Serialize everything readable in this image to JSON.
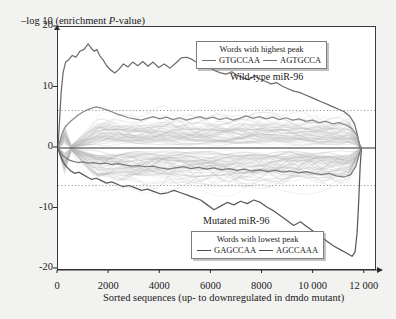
{
  "chart_data": {
    "type": "line",
    "title": "",
    "ylabel": "–log 10 (enrichment P-value)",
    "xlabel": "Sorted sequences (up- to downregulated in dmdo mutant)",
    "xlim": [
      0,
      12400
    ],
    "ylim": [
      -20,
      20
    ],
    "xticks": [
      0,
      2000,
      4000,
      6000,
      8000,
      10000,
      12000
    ],
    "xtick_labels": [
      "0",
      "2000",
      "4000",
      "6000",
      "8000",
      "10 000",
      "12 000"
    ],
    "yticks": [
      20,
      10,
      0,
      -10,
      -20
    ],
    "ytick_labels": [
      "20",
      "10",
      "0",
      "-10",
      "-20"
    ],
    "grid": false,
    "legend_position": "inside-top-right",
    "threshold_lines": [
      6.2,
      -6.2
    ],
    "threshold_style": "dotted",
    "zero_line": 0,
    "annotations": [
      {
        "text": "Wild-type miR-96",
        "x": 7200,
        "y": 12.2
      },
      {
        "text": "Mutated miR-96",
        "x": 5800,
        "y": -11.6
      }
    ],
    "series": [
      {
        "name": "GTGCCAA",
        "group": "highest-peak",
        "color": "#6b6b6b",
        "x": [
          0,
          60,
          120,
          200,
          300,
          420,
          560,
          700,
          860,
          1020,
          1180,
          1320,
          1420,
          1520,
          1640,
          1760,
          1900,
          2060,
          2220,
          2380,
          2560,
          2740,
          2920,
          3120,
          3320,
          3520,
          3720,
          3940,
          4160,
          4380,
          4600,
          4820,
          5040,
          5260,
          5480,
          5700,
          5920,
          6140,
          6360,
          6580,
          6800,
          7020,
          7240,
          7460,
          7680,
          7900,
          8120,
          8340,
          8560,
          8780,
          9000,
          9220,
          9440,
          9660,
          9880,
          10100,
          10320,
          10540,
          10760,
          10980,
          11200,
          11420,
          11600,
          11720,
          11800,
          11850
        ],
        "y": [
          0,
          4.5,
          9.0,
          12.5,
          14.2,
          14.6,
          15.3,
          15.0,
          16.0,
          16.3,
          17.2,
          16.4,
          16.0,
          16.3,
          15.2,
          14.6,
          13.6,
          12.9,
          12.4,
          13.0,
          13.9,
          13.4,
          14.2,
          13.6,
          14.3,
          13.5,
          14.2,
          13.3,
          13.9,
          13.2,
          14.0,
          14.9,
          15.0,
          14.6,
          14.0,
          13.6,
          13.3,
          12.8,
          12.4,
          12.2,
          12.6,
          12.0,
          11.6,
          11.3,
          11.9,
          11.4,
          11.0,
          10.6,
          10.8,
          10.2,
          9.8,
          9.4,
          9.2,
          8.8,
          8.4,
          8.0,
          7.6,
          7.2,
          6.8,
          6.4,
          6.0,
          5.2,
          4.0,
          2.0,
          0.3,
          0
        ]
      },
      {
        "name": "AGTGCCA",
        "group": "highest-peak",
        "color": "#8a8a8a",
        "x": [
          0,
          80,
          180,
          300,
          440,
          600,
          780,
          960,
          1140,
          1320,
          1500,
          1700,
          1900,
          2100,
          2320,
          2540,
          2760,
          3000,
          3240,
          3480,
          3720,
          3980,
          4240,
          4500,
          4760,
          5020,
          5280,
          5540,
          5800,
          6060,
          6320,
          6580,
          6840,
          7100,
          7360,
          7620,
          7880,
          8140,
          8400,
          8660,
          8920,
          9180,
          9440,
          9700,
          9960,
          10220,
          10480,
          10740,
          11000,
          11260,
          11500,
          11680,
          11800,
          11860
        ],
        "y": [
          0,
          1.2,
          2.6,
          3.6,
          4.2,
          4.8,
          5.4,
          5.9,
          6.3,
          6.6,
          6.8,
          6.6,
          6.3,
          6.0,
          5.6,
          5.3,
          5.0,
          4.8,
          4.6,
          4.9,
          5.2,
          4.8,
          5.1,
          4.7,
          5.0,
          4.6,
          4.9,
          5.2,
          4.8,
          5.1,
          4.7,
          5.0,
          4.6,
          4.9,
          5.3,
          4.9,
          5.2,
          4.8,
          5.1,
          4.7,
          5.0,
          4.6,
          4.8,
          4.4,
          4.6,
          4.2,
          4.4,
          4.0,
          4.2,
          3.8,
          3.2,
          2.2,
          0.6,
          0
        ]
      },
      {
        "name": "GAGCCAA",
        "group": "lowest-peak",
        "color": "#5a5a5a",
        "x": [
          0,
          60,
          140,
          240,
          360,
          500,
          660,
          820,
          980,
          1140,
          1320,
          1500,
          1700,
          1900,
          2100,
          2320,
          2540,
          2780,
          3020,
          3260,
          3500,
          3760,
          4020,
          4280,
          4540,
          4800,
          5060,
          5320,
          5580,
          5840,
          6100,
          6360,
          6620,
          6880,
          7140,
          7400,
          7660,
          7920,
          8180,
          8440,
          8700,
          8960,
          9220,
          9480,
          9740,
          10000,
          10260,
          10520,
          10780,
          11040,
          11300,
          11500,
          11620,
          11700,
          11760,
          11820,
          11870
        ],
        "y": [
          0,
          -0.8,
          -1.8,
          -2.6,
          -3.2,
          -3.8,
          -4.2,
          -4.0,
          -4.4,
          -4.8,
          -5.2,
          -5.0,
          -5.4,
          -5.8,
          -5.6,
          -6.0,
          -6.4,
          -6.2,
          -6.6,
          -7.0,
          -6.8,
          -7.2,
          -7.6,
          -7.4,
          -7.0,
          -7.4,
          -7.8,
          -8.2,
          -8.6,
          -9.4,
          -10.2,
          -9.6,
          -9.0,
          -9.4,
          -8.8,
          -9.2,
          -8.6,
          -9.0,
          -9.8,
          -10.4,
          -11.2,
          -12.0,
          -12.8,
          -12.2,
          -13.0,
          -13.8,
          -14.6,
          -15.4,
          -16.2,
          -16.8,
          -17.4,
          -17.9,
          -17.2,
          -14.0,
          -9.0,
          -3.0,
          0
        ]
      },
      {
        "name": "AGCCAAA",
        "group": "lowest-peak",
        "color": "#7a7a7a",
        "x": [
          0,
          80,
          180,
          300,
          440,
          600,
          780,
          980,
          1180,
          1400,
          1620,
          1860,
          2100,
          2360,
          2620,
          2880,
          3160,
          3440,
          3720,
          4000,
          4300,
          4600,
          4900,
          5200,
          5500,
          5800,
          6100,
          6400,
          6700,
          7000,
          7300,
          7600,
          7900,
          8200,
          8500,
          8800,
          9100,
          9400,
          9700,
          10000,
          10300,
          10600,
          10900,
          11200,
          11450,
          11650,
          11800,
          11870
        ],
        "y": [
          0,
          -0.6,
          -1.2,
          -1.6,
          -2.0,
          -2.2,
          -2.4,
          -2.3,
          -2.5,
          -2.4,
          -2.6,
          -2.5,
          -2.7,
          -2.6,
          -2.8,
          -3.0,
          -2.9,
          -3.1,
          -3.0,
          -3.3,
          -3.5,
          -3.3,
          -3.1,
          -3.4,
          -3.2,
          -3.5,
          -3.3,
          -3.6,
          -3.4,
          -3.7,
          -3.5,
          -3.8,
          -3.6,
          -3.9,
          -3.7,
          -4.0,
          -3.8,
          -4.1,
          -3.9,
          -4.2,
          -4.4,
          -4.2,
          -4.6,
          -4.8,
          -4.4,
          -3.0,
          -0.8,
          0
        ]
      }
    ],
    "background_band": {
      "description": "dense overlay of many non-significant word curves forming a gray band around zero",
      "count": 120,
      "upper_envelope": 4.5,
      "lower_envelope": -5.0,
      "color": "#b8b8b8"
    }
  },
  "axis": {
    "y_title_prefix": "–log 10 (enrichment ",
    "y_title_italic": "P",
    "y_title_suffix": "-value)",
    "x_title": "Sorted sequences (up- to downregulated in dmdo mutant)"
  },
  "legend_top": {
    "title": "Words with highest peak",
    "entries": [
      {
        "label": "GTGCCAA"
      },
      {
        "label": "AGTGCCA"
      }
    ]
  },
  "legend_bottom": {
    "title": "Words with lowest peak",
    "entries": [
      {
        "label": "GAGCCAA"
      },
      {
        "label": "AGCCAAA"
      }
    ]
  },
  "annotations": {
    "wildtype": "Wild-type miR-96",
    "mutated": "Mutated miR-96"
  }
}
